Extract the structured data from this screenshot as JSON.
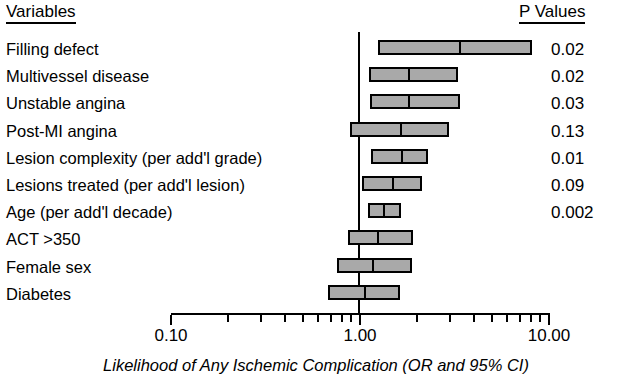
{
  "header": {
    "variables_label": "Variables",
    "pvalues_label": "P Values"
  },
  "axis": {
    "title": "Likelihood of Any Ischemic Complication (OR and 95% CI)",
    "tick_labels": [
      "0.10",
      "1.00",
      "10.00"
    ],
    "scale": "log",
    "min": 0.1,
    "max": 10.0,
    "reference_value": "1.00"
  },
  "colors": {
    "bar_fill": "#a9a9a9",
    "bar_stroke": "#000000",
    "axis": "#000000",
    "text": "#000000",
    "background": "#ffffff"
  },
  "rows": [
    {
      "label": "Filling defect",
      "p": "0.02",
      "or": 3.3,
      "lo": 1.25,
      "hi": 8.1
    },
    {
      "label": "Multivessel disease",
      "p": "0.02",
      "or": 1.78,
      "lo": 1.12,
      "hi": 3.3
    },
    {
      "label": "Unstable angina",
      "p": "0.03",
      "or": 1.78,
      "lo": 1.13,
      "hi": 3.4
    },
    {
      "label": "Post-MI angina",
      "p": "0.13",
      "or": 1.6,
      "lo": 0.88,
      "hi": 2.95
    },
    {
      "label": "Lesion complexity (per add'l grade)",
      "p": "0.01",
      "or": 1.62,
      "lo": 1.14,
      "hi": 2.3
    },
    {
      "label": "Lesions treated (per add'l lesion)",
      "p": "0.09",
      "or": 1.46,
      "lo": 1.03,
      "hi": 2.14
    },
    {
      "label": "Age (per add'l decade)",
      "p": "0.002",
      "or": 1.3,
      "lo": 1.1,
      "hi": 1.64
    },
    {
      "label": "ACT >350",
      "p": "",
      "or": 1.22,
      "lo": 0.86,
      "hi": 1.9
    },
    {
      "label": "Female sex",
      "p": "",
      "or": 1.14,
      "lo": 0.76,
      "hi": 1.88
    },
    {
      "label": "Diabetes",
      "p": "",
      "or": 1.04,
      "lo": 0.68,
      "hi": 1.63
    }
  ],
  "chart_data": {
    "type": "forest",
    "title": "",
    "xlabel": "Likelihood of Any Ischemic Complication (OR and 95% CI)",
    "ylabel": "Variables",
    "xscale": "log",
    "xlim": [
      0.1,
      10.0
    ],
    "xticks": [
      0.1,
      1.0,
      10.0
    ],
    "xticklabels": [
      "0.10",
      "1.00",
      "10.00"
    ],
    "reference_line": 1.0,
    "grid": false,
    "legend": null,
    "categories": [
      "Filling defect",
      "Multivessel disease",
      "Unstable angina",
      "Post-MI angina",
      "Lesion complexity (per add'l grade)",
      "Lesions treated (per add'l lesion)",
      "Age (per add'l decade)",
      "ACT >350",
      "Female sex",
      "Diabetes"
    ],
    "odds_ratios": [
      3.3,
      1.78,
      1.78,
      1.6,
      1.62,
      1.46,
      1.3,
      1.22,
      1.14,
      1.04
    ],
    "ci_lower": [
      1.25,
      1.12,
      1.13,
      0.88,
      1.14,
      1.03,
      1.1,
      0.86,
      0.76,
      0.68
    ],
    "ci_upper": [
      8.1,
      3.3,
      3.4,
      2.95,
      2.3,
      2.14,
      1.64,
      1.9,
      1.88,
      1.63
    ],
    "p_values": [
      "0.02",
      "0.02",
      "0.03",
      "0.13",
      "0.01",
      "0.09",
      "0.002",
      "",
      "",
      ""
    ]
  }
}
